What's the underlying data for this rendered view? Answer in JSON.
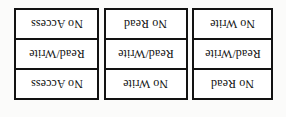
{
  "diagram": {
    "background_color": "#fbfbfa",
    "box_fill_color": "#ffffff",
    "border_color": "#121212",
    "text_color": "#101010",
    "text_orientation": "rotated-180",
    "boxes": [
      {
        "name": "box-1",
        "cells": [
          {
            "label": "No Access"
          },
          {
            "label": "Read/Write"
          },
          {
            "label": "No Access"
          }
        ]
      },
      {
        "name": "box-2",
        "cells": [
          {
            "label": "No Read"
          },
          {
            "label": "Read/Write"
          },
          {
            "label": "No Write"
          }
        ]
      },
      {
        "name": "box-3",
        "cells": [
          {
            "label": "No Write"
          },
          {
            "label": "Read/Write"
          },
          {
            "label": "No Read"
          }
        ]
      }
    ]
  }
}
